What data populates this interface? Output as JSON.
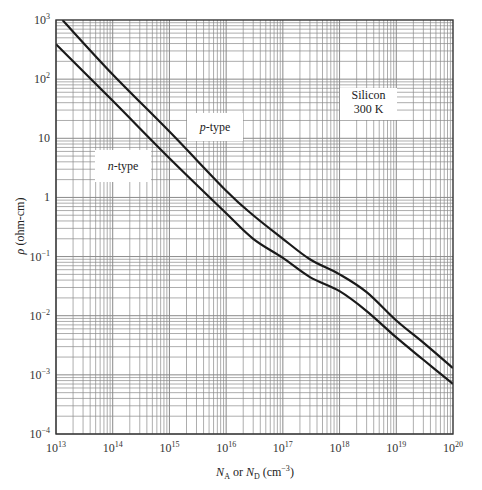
{
  "chart_data": {
    "type": "line",
    "title": "",
    "xlabel": "N_A or N_D (cm^-3)",
    "ylabel": "ρ (ohm-cm)",
    "xscale": "log",
    "yscale": "log",
    "xlim": [
      10000000000000.0,
      1e+20
    ],
    "ylim": [
      0.0001,
      1000.0
    ],
    "grid": true,
    "x_ticks": [
      {
        "base": "10",
        "exp": "13"
      },
      {
        "base": "10",
        "exp": "14"
      },
      {
        "base": "10",
        "exp": "15"
      },
      {
        "base": "10",
        "exp": "16"
      },
      {
        "base": "10",
        "exp": "17"
      },
      {
        "base": "10",
        "exp": "18"
      },
      {
        "base": "10",
        "exp": "19"
      },
      {
        "base": "10",
        "exp": "20"
      }
    ],
    "y_ticks": [
      {
        "base": "10",
        "exp": "−4"
      },
      {
        "base": "10",
        "exp": "−3"
      },
      {
        "base": "10",
        "exp": "−2"
      },
      {
        "base": "10",
        "exp": "−1"
      },
      {
        "base": "1",
        "exp": ""
      },
      {
        "base": "10",
        "exp": ""
      },
      {
        "base": "10",
        "exp": "2"
      },
      {
        "base": "10",
        "exp": "3"
      }
    ],
    "x": [
      10000000000000.0,
      100000000000000.0,
      1000000000000000.0,
      1e+16,
      1e+17,
      1e+18,
      1e+19,
      1e+20
    ],
    "series": [
      {
        "name": "p-type",
        "x": [
          13000000000000.0,
          100000000000000.0,
          1000000000000000.0,
          1e+16,
          3e+16,
          1e+17,
          3e+17,
          1e+18,
          3e+18,
          1e+19,
          3e+19,
          1e+20
        ],
        "values": [
          1000,
          120,
          13,
          1.3,
          0.5,
          0.2,
          0.09,
          0.05,
          0.025,
          0.0083,
          0.0035,
          0.0013
        ]
      },
      {
        "name": "n-type",
        "x": [
          10000000000000.0,
          100000000000000.0,
          1000000000000000.0,
          1e+16,
          3e+16,
          1e+17,
          3e+17,
          1e+18,
          3e+18,
          1e+19,
          3e+19,
          1e+20
        ],
        "values": [
          390,
          43,
          4.6,
          0.54,
          0.2,
          0.095,
          0.045,
          0.026,
          0.012,
          0.0043,
          0.0018,
          0.0007
        ]
      }
    ],
    "annotations": [
      {
        "text": "p-type",
        "italic_part": "p",
        "rest": "-type",
        "box": [
          187,
          113,
          56,
          28
        ]
      },
      {
        "text": "n-type",
        "italic_part": "n",
        "rest": "-type",
        "box": [
          95,
          150,
          56,
          32
        ]
      },
      {
        "text": "Silicon 300 K",
        "lines": [
          "Silicon",
          "300 K"
        ],
        "box": [
          340,
          88,
          57,
          32
        ]
      }
    ]
  },
  "axes": {
    "ylabel_symbol": "ρ",
    "ylabel_units": " (ohm-cm)",
    "xlabel_N": "N",
    "xlabel_subA": "A",
    "xlabel_or": " or ",
    "xlabel_subD": "D",
    "xlabel_units_pre": " (cm",
    "xlabel_units_exp": "−3",
    "xlabel_units_post": ")"
  },
  "colors": {
    "grid": "#8a8a8a",
    "axis": "#333333",
    "curve": "#1a1a1a",
    "background": "#ffffff"
  }
}
